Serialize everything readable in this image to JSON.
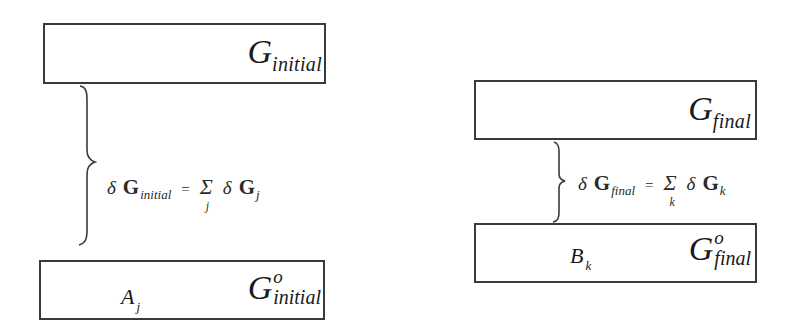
{
  "diagram": {
    "left_panel": {
      "top_box": {
        "symbol": "G",
        "subscript": "initial"
      },
      "equation": {
        "delta": "δ",
        "lhs_symbol": "G",
        "lhs_subscript": "initial",
        "equals": "=",
        "sum_symbol": "Σ",
        "sum_index": "j",
        "rhs_delta": "δ",
        "rhs_symbol": "G",
        "rhs_subscript": "j"
      },
      "bottom_box": {
        "species": "A",
        "species_subscript": "j",
        "symbol": "G",
        "superscript": "o",
        "subscript": "initial"
      }
    },
    "right_panel": {
      "top_box": {
        "symbol": "G",
        "subscript": "final"
      },
      "equation": {
        "delta": "δ",
        "lhs_symbol": "G",
        "lhs_subscript": "final",
        "equals": "=",
        "sum_symbol": "Σ",
        "sum_index": "k",
        "rhs_delta": "δ",
        "rhs_symbol": "G",
        "rhs_subscript": "k"
      },
      "bottom_box": {
        "species": "B",
        "species_subscript": "k",
        "symbol": "G",
        "superscript": "o",
        "subscript": "final"
      }
    },
    "colors": {
      "line": "#3a3a3a",
      "text": "#1a1a1a",
      "background": "#ffffff"
    }
  }
}
